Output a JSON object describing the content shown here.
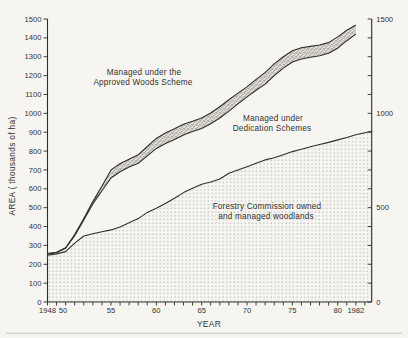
{
  "figure": {
    "background": "#f6f5f1",
    "line_color": "#2e2d2b",
    "text_color": "#33322f",
    "dot_color": "#98968f",
    "stipple_dot_color": "#6f6d66",
    "stipple_bg": "#e3e1da",
    "scan_artifact_color": "#d8d7d1"
  },
  "chart_data": {
    "type": "area",
    "title": "",
    "xlabel": "YEAR",
    "ylabel": "AREA ( thousands of ha)",
    "x_range": [
      1948,
      1983.75
    ],
    "y_range": [
      0,
      1500
    ],
    "grid": false,
    "legend_position": "annotations-inside-plot",
    "x_ticks_labeled": [
      {
        "label": "1948",
        "year": 1948
      },
      {
        "label": "50",
        "year": 1949.7
      },
      {
        "label": "55",
        "year": 1955
      },
      {
        "label": "60",
        "year": 1960
      },
      {
        "label": "65",
        "year": 1965
      },
      {
        "label": "70",
        "year": 1970
      },
      {
        "label": "75",
        "year": 1975
      },
      {
        "label": "80",
        "year": 1980
      },
      {
        "label": "1982",
        "year": 1982
      }
    ],
    "x_minor_tick_years": [
      1948,
      1949,
      1950,
      1951,
      1952,
      1953,
      1954,
      1955,
      1956,
      1957,
      1958,
      1959,
      1960,
      1961,
      1962,
      1963,
      1964,
      1965,
      1966,
      1967,
      1968,
      1969,
      1970,
      1971,
      1972,
      1973,
      1974,
      1975,
      1976,
      1977,
      1978,
      1979,
      1980,
      1981,
      1982,
      1983
    ],
    "y_left_tick_labels": [
      "0",
      "100",
      "200",
      "300",
      "400",
      "500",
      "600",
      "700",
      "800",
      "900",
      "1000",
      "1100",
      "1200",
      "1300",
      "1400",
      "1500"
    ],
    "y_left_tick_values": [
      0,
      100,
      200,
      300,
      400,
      500,
      600,
      700,
      800,
      900,
      1000,
      1100,
      1200,
      1300,
      1400,
      1500
    ],
    "y_right_tick_values": [
      0,
      100,
      200,
      300,
      400,
      500,
      600,
      700,
      800,
      900,
      1000,
      1100,
      1200,
      1300,
      1400,
      1500
    ],
    "y_right_labeled": [
      {
        "label": "0",
        "value": 0
      },
      {
        "label": "500",
        "value": 500
      },
      {
        "label": "1000",
        "value": 1000
      },
      {
        "label": "1500",
        "value": 1500
      }
    ],
    "series": [
      {
        "name": "Forestry Commission owned and managed woodlands",
        "role": "boundary-forestry-commission",
        "fill_below": "dots",
        "points": [
          [
            1948,
            248
          ],
          [
            1949,
            255
          ],
          [
            1950,
            267
          ],
          [
            1951,
            312
          ],
          [
            1952,
            350
          ],
          [
            1953,
            362
          ],
          [
            1954,
            372
          ],
          [
            1955,
            382
          ],
          [
            1956,
            398
          ],
          [
            1957,
            420
          ],
          [
            1958,
            442
          ],
          [
            1959,
            475
          ],
          [
            1960,
            497
          ],
          [
            1961,
            522
          ],
          [
            1962,
            550
          ],
          [
            1963,
            580
          ],
          [
            1964,
            603
          ],
          [
            1965,
            624
          ],
          [
            1966,
            636
          ],
          [
            1967,
            652
          ],
          [
            1968,
            682
          ],
          [
            1969,
            700
          ],
          [
            1970,
            717
          ],
          [
            1971,
            735
          ],
          [
            1972,
            753
          ],
          [
            1973,
            765
          ],
          [
            1974,
            780
          ],
          [
            1975,
            797
          ],
          [
            1976,
            810
          ],
          [
            1977,
            823
          ],
          [
            1978,
            835
          ],
          [
            1979,
            846
          ],
          [
            1980,
            859
          ],
          [
            1981,
            872
          ],
          [
            1982,
            886
          ],
          [
            1983.75,
            905
          ]
        ]
      },
      {
        "name": "Managed under Dedication Schemes",
        "role": "boundary-fc-plus-dedication",
        "fill_below": "none",
        "points": [
          [
            1948,
            255
          ],
          [
            1949,
            262
          ],
          [
            1950,
            285
          ],
          [
            1951,
            352
          ],
          [
            1952,
            435
          ],
          [
            1953,
            520
          ],
          [
            1954,
            590
          ],
          [
            1955,
            657
          ],
          [
            1956,
            690
          ],
          [
            1957,
            715
          ],
          [
            1958,
            735
          ],
          [
            1959,
            775
          ],
          [
            1960,
            814
          ],
          [
            1961,
            840
          ],
          [
            1962,
            862
          ],
          [
            1963,
            885
          ],
          [
            1964,
            903
          ],
          [
            1965,
            920
          ],
          [
            1966,
            945
          ],
          [
            1967,
            975
          ],
          [
            1968,
            1012
          ],
          [
            1969,
            1050
          ],
          [
            1970,
            1087
          ],
          [
            1971,
            1122
          ],
          [
            1972,
            1155
          ],
          [
            1973,
            1200
          ],
          [
            1974,
            1240
          ],
          [
            1975,
            1272
          ],
          [
            1976,
            1288
          ],
          [
            1977,
            1297
          ],
          [
            1978,
            1305
          ],
          [
            1979,
            1318
          ],
          [
            1980,
            1345
          ],
          [
            1981,
            1385
          ],
          [
            1982,
            1420
          ]
        ]
      },
      {
        "name": "Managed under the Approved Woods Scheme",
        "role": "boundary-total",
        "fill_band_to_previous": "stipple",
        "points": [
          [
            1948,
            257
          ],
          [
            1949,
            264
          ],
          [
            1950,
            288
          ],
          [
            1951,
            357
          ],
          [
            1952,
            443
          ],
          [
            1953,
            532
          ],
          [
            1954,
            614
          ],
          [
            1955,
            700
          ],
          [
            1956,
            733
          ],
          [
            1957,
            757
          ],
          [
            1958,
            780
          ],
          [
            1959,
            824
          ],
          [
            1960,
            867
          ],
          [
            1961,
            895
          ],
          [
            1962,
            918
          ],
          [
            1963,
            942
          ],
          [
            1964,
            958
          ],
          [
            1965,
            975
          ],
          [
            1966,
            1002
          ],
          [
            1967,
            1035
          ],
          [
            1968,
            1072
          ],
          [
            1969,
            1107
          ],
          [
            1970,
            1140
          ],
          [
            1971,
            1180
          ],
          [
            1972,
            1216
          ],
          [
            1973,
            1262
          ],
          [
            1974,
            1300
          ],
          [
            1975,
            1332
          ],
          [
            1976,
            1348
          ],
          [
            1977,
            1355
          ],
          [
            1978,
            1362
          ],
          [
            1979,
            1375
          ],
          [
            1980,
            1405
          ],
          [
            1981,
            1440
          ],
          [
            1982,
            1468
          ]
        ]
      }
    ],
    "annotations": [
      {
        "lines": [
          "Managed under the",
          "Approved Woods Scheme"
        ]
      },
      {
        "lines": [
          "Managed under",
          "Dedication Schemes"
        ]
      },
      {
        "lines": [
          "Forestry Commission owned",
          "and managed woodlands"
        ]
      }
    ]
  }
}
